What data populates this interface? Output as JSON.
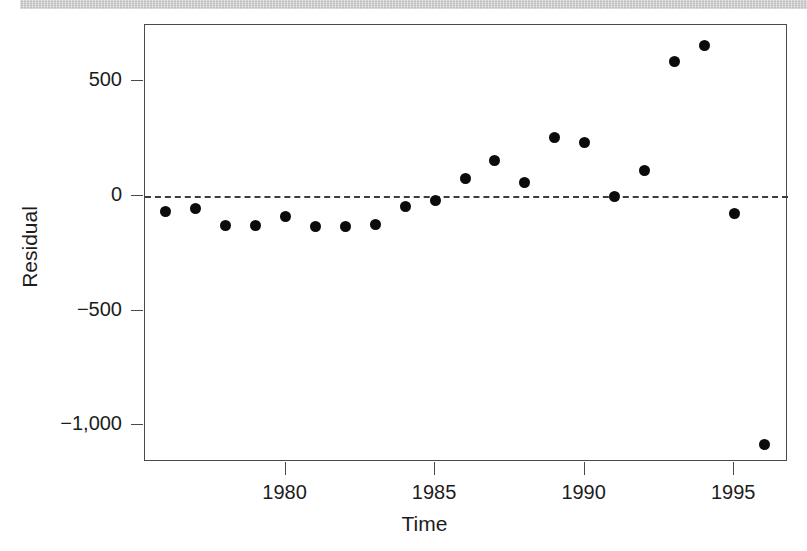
{
  "figure": {
    "background_color": "#ffffff",
    "scan_band": {
      "name": "scanned-page-edge-band",
      "color": "#bcbcbc"
    }
  },
  "chart_data": {
    "type": "scatter",
    "title": "",
    "subtitle": "",
    "xlabel": "Time",
    "ylabel": "Residual",
    "xlim": [
      1975.3,
      1996.8
    ],
    "ylim": [
      -1160,
      745
    ],
    "grid": false,
    "legend": null,
    "marker": {
      "shape": "circle",
      "filled": true,
      "color": "#0b0b0b",
      "size_px": 11
    },
    "annotations": [
      {
        "name": "zero-reference-line",
        "type": "hline",
        "y": 0,
        "style": "dashed",
        "color": "#3d3d3d"
      }
    ],
    "x_tick_labels": [
      "1980",
      "1985",
      "1990",
      "1995"
    ],
    "x_ticks": [
      1980,
      1985,
      1990,
      1995
    ],
    "y_tick_labels": [
      "500",
      "0",
      "−500",
      "−1,000"
    ],
    "y_ticks": [
      500,
      0,
      -500,
      -1000
    ],
    "x": [
      1976,
      1977,
      1978,
      1979,
      1980,
      1981,
      1982,
      1983,
      1984,
      1985,
      1986,
      1987,
      1988,
      1989,
      1990,
      1991,
      1992,
      1993,
      1994,
      1995,
      1996
    ],
    "values": [
      -70,
      -53,
      -127,
      -127,
      -88,
      -132,
      -132,
      -123,
      -48,
      -18,
      75,
      154,
      57,
      254,
      232,
      -4,
      110,
      588,
      654,
      -75,
      -1083
    ],
    "points": [
      {
        "x": 1976,
        "y": -70
      },
      {
        "x": 1977,
        "y": -53
      },
      {
        "x": 1978,
        "y": -127
      },
      {
        "x": 1979,
        "y": -127
      },
      {
        "x": 1980,
        "y": -88
      },
      {
        "x": 1981,
        "y": -132
      },
      {
        "x": 1982,
        "y": -132
      },
      {
        "x": 1983,
        "y": -123
      },
      {
        "x": 1984,
        "y": -48
      },
      {
        "x": 1985,
        "y": -18
      },
      {
        "x": 1986,
        "y": 75
      },
      {
        "x": 1987,
        "y": 154
      },
      {
        "x": 1988,
        "y": 57
      },
      {
        "x": 1989,
        "y": 254
      },
      {
        "x": 1990,
        "y": 232
      },
      {
        "x": 1991,
        "y": -4
      },
      {
        "x": 1992,
        "y": 110
      },
      {
        "x": 1993,
        "y": 588
      },
      {
        "x": 1994,
        "y": 654
      },
      {
        "x": 1995,
        "y": -75
      },
      {
        "x": 1996,
        "y": -1083
      }
    ]
  }
}
